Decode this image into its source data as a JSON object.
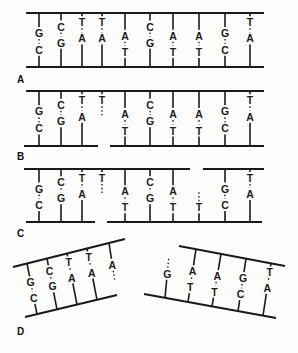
{
  "figure": {
    "panels": [
      {
        "label": "A",
        "pairs": [
          {
            "top": "G",
            "bottom": "C"
          },
          {
            "top": "C",
            "bottom": "G"
          },
          {
            "top": "T",
            "bottom": "A"
          },
          {
            "top": "T",
            "bottom": "A"
          },
          {
            "top": "A",
            "bottom": "T"
          },
          {
            "top": "C",
            "bottom": "G"
          },
          {
            "top": "A",
            "bottom": "T"
          },
          {
            "top": "A",
            "bottom": "T"
          },
          {
            "top": "G",
            "bottom": "C"
          },
          {
            "top": "T",
            "bottom": "A"
          }
        ],
        "nicks": []
      },
      {
        "label": "B",
        "pairs": [
          {
            "top": "G",
            "bottom": "C"
          },
          {
            "top": "C",
            "bottom": "G"
          },
          {
            "top": "T",
            "bottom": "A"
          },
          {
            "top": "T",
            "bottom": ""
          },
          {
            "top": "A",
            "bottom": "T"
          },
          {
            "top": "C",
            "bottom": "G"
          },
          {
            "top": "A",
            "bottom": "T"
          },
          {
            "top": "A",
            "bottom": "T"
          },
          {
            "top": "G",
            "bottom": "C"
          },
          {
            "top": "T",
            "bottom": "A"
          }
        ],
        "nicks": [
          "bottom strand between pair 3 and 5"
        ]
      },
      {
        "label": "C",
        "pairs": [
          {
            "top": "G",
            "bottom": "C"
          },
          {
            "top": "C",
            "bottom": "G"
          },
          {
            "top": "T",
            "bottom": "A"
          },
          {
            "top": "T",
            "bottom": ""
          },
          {
            "top": "A",
            "bottom": "T"
          },
          {
            "top": "C",
            "bottom": "G"
          },
          {
            "top": "A",
            "bottom": "T"
          },
          {
            "top": "",
            "bottom": "T"
          },
          {
            "top": "G",
            "bottom": "C"
          },
          {
            "top": "T",
            "bottom": "A"
          }
        ],
        "nicks": [
          "bottom strand between pair 3 and 5",
          "top strand between pair 7 and 9"
        ]
      },
      {
        "label": "D",
        "fragments": [
          {
            "name": "left fragment",
            "pairs": [
              {
                "top": "G",
                "bottom": "C"
              },
              {
                "top": "C",
                "bottom": "G"
              },
              {
                "top": "T",
                "bottom": "A"
              },
              {
                "top": "T",
                "bottom": "A"
              },
              {
                "top": "A",
                "bottom": ""
              }
            ]
          },
          {
            "name": "right fragment",
            "pairs": [
              {
                "top": "",
                "bottom": "G"
              },
              {
                "top": "A",
                "bottom": "T"
              },
              {
                "top": "A",
                "bottom": "T"
              },
              {
                "top": "G",
                "bottom": "C"
              },
              {
                "top": "T",
                "bottom": "A"
              }
            ]
          }
        ]
      }
    ]
  },
  "labels": {
    "a": "A",
    "b": "B",
    "c": "C",
    "d": "D"
  }
}
